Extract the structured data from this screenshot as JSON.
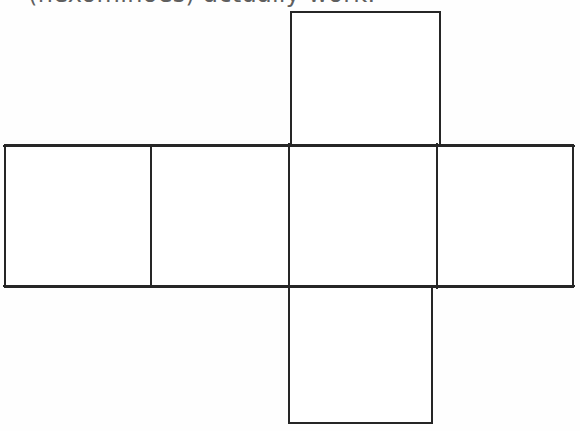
{
  "page": {
    "background_color": "#fefefe",
    "width": 580,
    "height": 431
  },
  "caption": {
    "text": "(hexominoes) actually work.",
    "color": "#4a4a4a",
    "clipped": "true"
  },
  "figure": {
    "name": "cube-net-hexomino",
    "stroke_color": "#262626",
    "fill_color": "#ffffff",
    "stroke_width": 2,
    "squares": [
      {
        "id": "top-square",
        "x": 291,
        "y": 12,
        "w": 149,
        "h": 135
      },
      {
        "id": "row-square-1",
        "x": 5,
        "y": 145,
        "w": 146,
        "h": 142
      },
      {
        "id": "row-square-2",
        "x": 151,
        "y": 145,
        "w": 138,
        "h": 142
      },
      {
        "id": "row-square-3-center",
        "x": 289,
        "y": 145,
        "w": 148,
        "h": 142
      },
      {
        "id": "row-square-4",
        "x": 437,
        "y": 145,
        "w": 136,
        "h": 142
      },
      {
        "id": "bottom-square",
        "x": 289,
        "y": 287,
        "w": 143,
        "h": 136
      }
    ]
  }
}
